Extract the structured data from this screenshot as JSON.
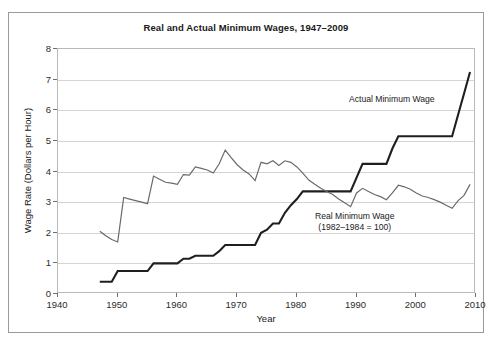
{
  "chart_data": {
    "type": "line",
    "title": "Real and Actual Minimum Wages, 1947–2009",
    "xlabel": "Year",
    "ylabel": "Wage Rate (Dollars per Hour)",
    "xlim": [
      1940,
      2010
    ],
    "ylim": [
      0,
      8
    ],
    "xticks": [
      1940,
      1950,
      1960,
      1970,
      1980,
      1990,
      2000,
      2010
    ],
    "yticks": [
      0,
      1,
      2,
      3,
      4,
      5,
      6,
      7,
      8
    ],
    "grid": "horizontal",
    "legend_position": "inline-annotations",
    "annotations": [
      {
        "id": "actual",
        "text": "Actual Minimum Wage",
        "x": 1996,
        "y": 6.2
      },
      {
        "id": "real",
        "line1": "Real Minimum Wage",
        "line2": "(1982–1984 = 100)",
        "x": 1995,
        "y": 2.45
      }
    ],
    "series": [
      {
        "name": "Actual Minimum Wage",
        "color": "#1f1f1f",
        "width": 2.1,
        "x": [
          1947,
          1949,
          1950,
          1955,
          1956,
          1960,
          1961,
          1962,
          1963,
          1966,
          1967,
          1968,
          1973,
          1974,
          1975,
          1976,
          1977,
          1978,
          1979,
          1980,
          1981,
          1989,
          1990,
          1991,
          1995,
          1996,
          1997,
          2006,
          2007,
          2008,
          2009
        ],
        "y": [
          0.4,
          0.4,
          0.75,
          0.75,
          1.0,
          1.0,
          1.15,
          1.15,
          1.25,
          1.25,
          1.4,
          1.6,
          1.6,
          2.0,
          2.1,
          2.3,
          2.3,
          2.65,
          2.9,
          3.1,
          3.35,
          3.35,
          3.8,
          4.25,
          4.25,
          4.75,
          5.15,
          5.15,
          5.85,
          6.55,
          7.25
        ]
      },
      {
        "name": "Real Minimum Wage",
        "color": "#6a6a6a",
        "width": 1.2,
        "x": [
          1947,
          1948,
          1949,
          1950,
          1951,
          1952,
          1953,
          1954,
          1955,
          1956,
          1957,
          1958,
          1959,
          1960,
          1961,
          1962,
          1963,
          1964,
          1965,
          1966,
          1967,
          1968,
          1969,
          1970,
          1971,
          1972,
          1973,
          1974,
          1975,
          1976,
          1977,
          1978,
          1979,
          1980,
          1981,
          1982,
          1983,
          1984,
          1985,
          1986,
          1987,
          1988,
          1989,
          1990,
          1991,
          1992,
          1993,
          1994,
          1995,
          1996,
          1997,
          1998,
          1999,
          2000,
          2001,
          2002,
          2003,
          2004,
          2005,
          2006,
          2007,
          2008,
          2009
        ],
        "y": [
          2.05,
          1.9,
          1.78,
          1.7,
          3.15,
          3.1,
          3.05,
          3.0,
          2.95,
          3.85,
          3.75,
          3.65,
          3.62,
          3.58,
          3.9,
          3.88,
          4.15,
          4.1,
          4.05,
          3.95,
          4.25,
          4.7,
          4.45,
          4.22,
          4.05,
          3.92,
          3.7,
          4.3,
          4.25,
          4.35,
          4.2,
          4.35,
          4.3,
          4.15,
          3.95,
          3.72,
          3.58,
          3.45,
          3.35,
          3.25,
          3.1,
          2.98,
          2.85,
          3.3,
          3.45,
          3.35,
          3.25,
          3.18,
          3.08,
          3.3,
          3.55,
          3.5,
          3.42,
          3.3,
          3.2,
          3.15,
          3.08,
          3.0,
          2.9,
          2.8,
          3.05,
          3.22,
          3.58
        ]
      }
    ]
  }
}
